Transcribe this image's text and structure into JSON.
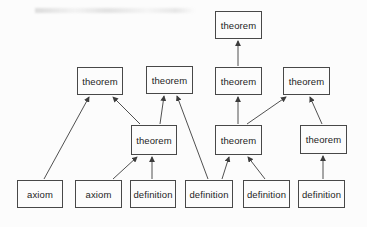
{
  "diagram": {
    "background_color": "#fcfcfc",
    "box_border_color": "#484848",
    "arrow_color": "#3c3c3c",
    "text_color": "#1d1d1d",
    "nodes": [
      {
        "id": "theorem-top",
        "label": "theorem",
        "x": 215,
        "y": 11,
        "w": 47,
        "h": 28
      },
      {
        "id": "theorem-r2c1",
        "label": "theorem",
        "x": 77,
        "y": 67,
        "w": 46,
        "h": 28
      },
      {
        "id": "theorem-r2c2",
        "label": "theorem",
        "x": 146,
        "y": 66,
        "w": 47,
        "h": 28
      },
      {
        "id": "theorem-r2c3",
        "label": "theorem",
        "x": 215,
        "y": 67,
        "w": 47,
        "h": 28
      },
      {
        "id": "theorem-r2c4",
        "label": "theorem",
        "x": 283,
        "y": 67,
        "w": 47,
        "h": 28
      },
      {
        "id": "theorem-r3c1",
        "label": "theorem",
        "x": 131,
        "y": 125,
        "w": 46,
        "h": 30
      },
      {
        "id": "theorem-r3c2",
        "label": "theorem",
        "x": 215,
        "y": 125,
        "w": 47,
        "h": 30
      },
      {
        "id": "theorem-r3c3",
        "label": "theorem",
        "x": 300,
        "y": 125,
        "w": 47,
        "h": 29
      },
      {
        "id": "axiom-1",
        "label": "axiom",
        "x": 17,
        "y": 180,
        "w": 46,
        "h": 28
      },
      {
        "id": "axiom-2",
        "label": "axiom",
        "x": 75,
        "y": 180,
        "w": 47,
        "h": 28
      },
      {
        "id": "definition-1",
        "label": "definition",
        "x": 130,
        "y": 180,
        "w": 46,
        "h": 28
      },
      {
        "id": "definition-2",
        "label": "definition",
        "x": 185,
        "y": 180,
        "w": 48,
        "h": 28
      },
      {
        "id": "definition-3",
        "label": "definition",
        "x": 243,
        "y": 180,
        "w": 47,
        "h": 28
      },
      {
        "id": "definition-4",
        "label": "definition",
        "x": 298,
        "y": 180,
        "w": 47,
        "h": 28
      }
    ],
    "edges": [
      {
        "from": "theorem-r2c3",
        "to": "theorem-top",
        "x1": 238,
        "y1": 66,
        "x2": 238,
        "y2": 41
      },
      {
        "from": "axiom-1",
        "to": "theorem-r2c1",
        "x1": 44,
        "y1": 179,
        "x2": 89,
        "y2": 97
      },
      {
        "from": "theorem-r3c1",
        "to": "theorem-r2c1",
        "x1": 140,
        "y1": 124,
        "x2": 113,
        "y2": 97
      },
      {
        "from": "theorem-r3c1",
        "to": "theorem-r2c2",
        "x1": 160,
        "y1": 124,
        "x2": 164,
        "y2": 96
      },
      {
        "from": "definition-2",
        "to": "theorem-r2c2",
        "x1": 208,
        "y1": 179,
        "x2": 177,
        "y2": 96
      },
      {
        "from": "theorem-r3c2",
        "to": "theorem-r2c3",
        "x1": 238,
        "y1": 124,
        "x2": 238,
        "y2": 97
      },
      {
        "from": "theorem-r3c2",
        "to": "theorem-r2c4",
        "x1": 247,
        "y1": 124,
        "x2": 286,
        "y2": 97
      },
      {
        "from": "theorem-r3c3",
        "to": "theorem-r2c4",
        "x1": 322,
        "y1": 124,
        "x2": 310,
        "y2": 97
      },
      {
        "from": "axiom-2",
        "to": "theorem-r3c1",
        "x1": 113,
        "y1": 179,
        "x2": 137,
        "y2": 157
      },
      {
        "from": "definition-1",
        "to": "theorem-r3c1",
        "x1": 152,
        "y1": 179,
        "x2": 152,
        "y2": 157
      },
      {
        "from": "definition-2",
        "to": "theorem-r3c2",
        "x1": 222,
        "y1": 179,
        "x2": 229,
        "y2": 157
      },
      {
        "from": "definition-3",
        "to": "theorem-r3c2",
        "x1": 265,
        "y1": 179,
        "x2": 248,
        "y2": 157
      },
      {
        "from": "definition-4",
        "to": "theorem-r3c3",
        "x1": 323,
        "y1": 179,
        "x2": 323,
        "y2": 156
      }
    ]
  }
}
